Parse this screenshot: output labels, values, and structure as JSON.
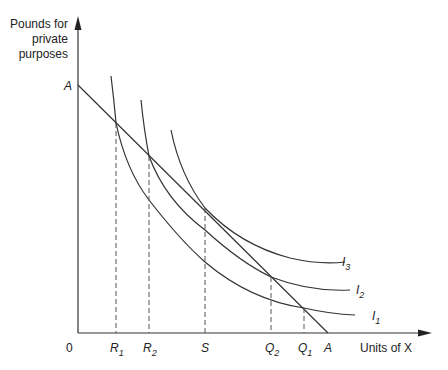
{
  "axes": {
    "y_label_lines": [
      "Pounds for",
      "private",
      "purposes"
    ],
    "x_label": "Units of X",
    "origin_label": "0"
  },
  "budget_line": {
    "label_y": "A",
    "label_x": "A"
  },
  "curves": [
    {
      "name": "I",
      "sub": "1"
    },
    {
      "name": "I",
      "sub": "2"
    },
    {
      "name": "I",
      "sub": "3"
    }
  ],
  "x_ticks": [
    {
      "name": "R",
      "sub": "1"
    },
    {
      "name": "R",
      "sub": "2"
    },
    {
      "name": "S",
      "sub": ""
    },
    {
      "name": "Q",
      "sub": "2"
    },
    {
      "name": "Q",
      "sub": "1"
    }
  ],
  "colors": {
    "line": "#333333",
    "dash": "#555555"
  }
}
